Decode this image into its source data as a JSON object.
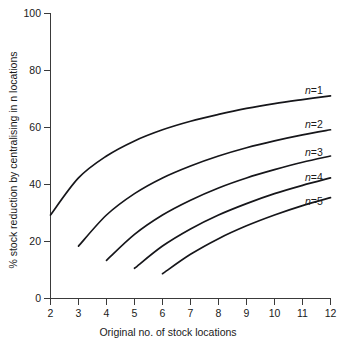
{
  "chart_data": {
    "type": "line",
    "title": "",
    "subtitle": "",
    "xlabel": "Original no. of stock locations",
    "ylabel": "% stock reduction by centralising in n locations",
    "xlim": [
      2,
      12
    ],
    "ylim": [
      0,
      100
    ],
    "xticks": [
      2,
      3,
      4,
      5,
      6,
      7,
      8,
      9,
      10,
      11,
      12
    ],
    "xtick_labels": [
      "2",
      "3",
      "4",
      "5",
      "6",
      "7",
      "8",
      "9",
      "10",
      "11",
      "12"
    ],
    "yticks": [
      0,
      20,
      40,
      60,
      80,
      100
    ],
    "ytick_labels": [
      "0",
      "20",
      "40",
      "60",
      "80",
      "100"
    ],
    "grid": false,
    "legend_position": "inline-right-of-curve",
    "line_color": "#16161a",
    "axis_color": "#3a3a3a",
    "series": [
      {
        "name": "n=1",
        "label": "n=1",
        "n": 1,
        "x": [
          2,
          3,
          4,
          5,
          6,
          7,
          8,
          9,
          10,
          11,
          12
        ],
        "values": [
          29.3,
          42.3,
          50.0,
          55.3,
          59.2,
          62.2,
          64.6,
          66.7,
          68.4,
          69.8,
          71.1
        ]
      },
      {
        "name": "n=2",
        "label": "n=2",
        "n": 2,
        "x": [
          3,
          4,
          5,
          6,
          7,
          8,
          9,
          10,
          11,
          12
        ],
        "values": [
          18.4,
          29.3,
          36.8,
          42.3,
          46.5,
          50.0,
          52.9,
          55.3,
          57.4,
          59.2
        ]
      },
      {
        "name": "n=3",
        "label": "n=3",
        "n": 3,
        "x": [
          4,
          5,
          6,
          7,
          8,
          9,
          10,
          11,
          12
        ],
        "values": [
          13.4,
          22.5,
          29.3,
          34.5,
          38.8,
          42.3,
          45.2,
          47.8,
          50.0
        ]
      },
      {
        "name": "n=4",
        "label": "n=4",
        "n": 4,
        "x": [
          5,
          6,
          7,
          8,
          9,
          10,
          11,
          12
        ],
        "values": [
          10.6,
          18.4,
          24.4,
          29.3,
          33.3,
          36.8,
          39.7,
          42.3
        ]
      },
      {
        "name": "n=5",
        "label": "n=5",
        "n": 5,
        "x": [
          6,
          7,
          8,
          9,
          10,
          11,
          12
        ],
        "values": [
          8.7,
          15.5,
          21.0,
          25.5,
          29.3,
          32.6,
          35.4
        ]
      }
    ],
    "curve_labels": [
      {
        "text": "n=1",
        "n": 1
      },
      {
        "text": "n=2",
        "n": 2
      },
      {
        "text": "n=3",
        "n": 3
      },
      {
        "text": "n=4",
        "n": 4
      },
      {
        "text": "n=5",
        "n": 5
      }
    ]
  }
}
